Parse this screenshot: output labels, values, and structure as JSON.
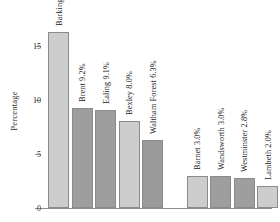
{
  "chart_data": {
    "type": "bar",
    "title": "",
    "xlabel": "",
    "ylabel": "Percentage",
    "ylim": [
      0,
      17
    ],
    "yticks": [
      0,
      5,
      10,
      15
    ],
    "ytick_labels": [
      "0",
      "5",
      "10",
      "15"
    ],
    "grid": false,
    "legend": null,
    "value_unit": "%",
    "categories": [
      "Barking and Dagenham",
      "Brent",
      "Ealing",
      "Bexley",
      "Waltham Forest",
      "Barnet",
      "Wandsworth",
      "Westminster",
      "Lambeth",
      "City of London"
    ],
    "values": [
      16.3,
      9.2,
      9.1,
      8.0,
      6.3,
      3.0,
      3.0,
      2.8,
      2.0,
      1.4
    ],
    "bars": [
      {
        "label": "Barking and Dagenham 16.3%",
        "category": "Barking and Dagenham",
        "value": 16.3,
        "color": "#cdcdcd",
        "group": "top"
      },
      {
        "label": "Brent 9.2%",
        "category": "Brent",
        "value": 9.2,
        "color": "#9e9e9e",
        "group": "top"
      },
      {
        "label": "Ealing 9.1%",
        "category": "Ealing",
        "value": 9.1,
        "color": "#9e9e9e",
        "group": "top"
      },
      {
        "label": "Bexley 8.0%",
        "category": "Bexley",
        "value": 8.0,
        "color": "#cdcdcd",
        "group": "top"
      },
      {
        "label": "Waltham Forest 6.3%",
        "category": "Waltham Forest",
        "value": 6.3,
        "color": "#9a9a9a",
        "group": "top"
      },
      {
        "label": "Barnet 3.0%",
        "category": "Barnet",
        "value": 3.0,
        "color": "#cdcdcd",
        "group": "bottom"
      },
      {
        "label": "Wandsworth 3.0%",
        "category": "Wandsworth",
        "value": 3.0,
        "color": "#9e9e9e",
        "group": "bottom"
      },
      {
        "label": "Westminster 2.8%",
        "category": "Westminster",
        "value": 2.8,
        "color": "#9e9e9e",
        "group": "bottom"
      },
      {
        "label": "Lambeth 2.0%",
        "category": "Lambeth",
        "value": 2.0,
        "color": "#cdcdcd",
        "group": "bottom"
      },
      {
        "label": "City of London 1.4%",
        "category": "City of London",
        "value": 1.4,
        "color": "#9a9a9a",
        "group": "bottom"
      }
    ],
    "colors": {
      "light_bar": "#cdcdcd",
      "dark_bar": "#9e9e9e",
      "axis": "#8e8e8e",
      "text": "#1c1c1c",
      "background": "#ffffff"
    }
  }
}
